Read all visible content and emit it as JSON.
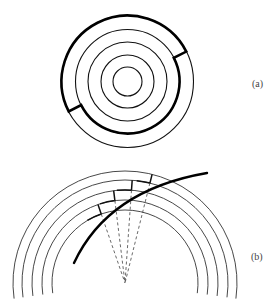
{
  "figure": {
    "panels": [
      {
        "id": "a",
        "label": "(a)",
        "description": "Five concentric circles; a thick closed path follows the outer circle over the top, steps inward to the second circle, follows it around the bottom, and steps back outward.",
        "center": [
          127.5,
          81.5
        ],
        "radii": [
          66,
          52,
          39.5,
          26.5,
          14.5
        ],
        "thick_path": {
          "outer_radius": 66,
          "inner_radius": 52,
          "step_angles_deg": [
            27,
            207
          ]
        },
        "colors": {
          "stroke": "#111111",
          "thick_stroke": "#000000"
        }
      },
      {
        "id": "b",
        "label": "(b)",
        "description": "Five concentric arcs with a thick curve crossing them; a staircase of ring segments and radial steps connects the curve, with dashed radial lines converging to the common center.",
        "center": [
          125,
          283
        ],
        "radii": [
          112,
          103,
          93,
          83,
          73
        ],
        "arc_extent_deg": [
          -8,
          188
        ],
        "thick_curve": {
          "start": [
            74,
            263
          ],
          "control": [
            108,
            190
          ],
          "end": [
            207,
            173
          ]
        },
        "steps": [
          {
            "radial_x_angle_deg": 109,
            "from_ring": 3,
            "to_ring": 4
          },
          {
            "radial_x_angle_deg": 97,
            "from_ring": 2,
            "to_ring": 3
          },
          {
            "radial_x_angle_deg": 86,
            "from_ring": 1,
            "to_ring": 2
          },
          {
            "radial_x_angle_deg": 76,
            "from_ring": 0,
            "to_ring": 1
          }
        ],
        "colors": {
          "stroke": "#333333",
          "thick_stroke": "#000000",
          "dashed": "#444444"
        }
      }
    ]
  }
}
